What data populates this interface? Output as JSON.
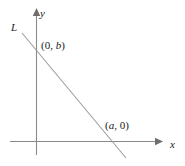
{
  "figure": {
    "name": "coordinate-plane-with-line",
    "width": 185,
    "height": 166,
    "background_color": "#ffffff",
    "stroke_color": "#808080",
    "text_color": "#1a1a1a"
  },
  "axes": {
    "origin": {
      "x": 36,
      "y": 141
    },
    "x_axis": {
      "label": "x",
      "start": {
        "x": 10,
        "y": 141
      },
      "end": {
        "x": 163,
        "y": 141
      },
      "arrow": "right"
    },
    "y_axis": {
      "label": "y",
      "start": {
        "x": 36,
        "y": 155
      },
      "end": {
        "x": 36,
        "y": 8
      },
      "arrow": "up"
    }
  },
  "line": {
    "label": "L",
    "start": {
      "x": 22,
      "y": 33
    },
    "end": {
      "x": 126,
      "y": 158
    },
    "y_intercept": {
      "x": 36,
      "y": 47
    },
    "x_intercept": {
      "x": 113,
      "y": 141
    }
  },
  "labels": {
    "y_intercept": {
      "open_paren": "(",
      "x_value": "0",
      "comma": ", ",
      "y_value": "b",
      "close_paren": ")",
      "text": "(0, b)"
    },
    "x_intercept": {
      "open_paren": "(",
      "x_value": "a",
      "comma": ", ",
      "y_value": "0",
      "close_paren": ")",
      "text": "(a, 0)"
    }
  }
}
